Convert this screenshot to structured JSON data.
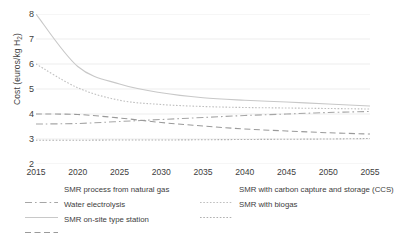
{
  "chart_data": {
    "type": "line",
    "title": "",
    "xlabel": "",
    "ylabel": "Cost (euros/kg H2)",
    "ylabel_prefix": "Cost (euros/kg H",
    "ylabel_sub": "2",
    "ylabel_suffix": ")",
    "x": [
      2015,
      2020,
      2025,
      2030,
      2035,
      2040,
      2045,
      2050,
      2055
    ],
    "xticklabels": [
      "2015",
      "2020",
      "2025",
      "2030",
      "2035",
      "2040",
      "2045",
      "2050",
      "2055"
    ],
    "yticklabels": [
      "8",
      "7",
      "6",
      "5",
      "4",
      "3",
      "2"
    ],
    "ylim": [
      2,
      8
    ],
    "xlim": [
      2015,
      2055
    ],
    "grid": true,
    "legend_position": "bottom",
    "series": [
      {
        "name": "SMR process from natural gas",
        "style": "dash-dot",
        "color": "#a6a6a6",
        "values": [
          3.6,
          3.62,
          3.7,
          3.78,
          3.86,
          3.94,
          4.0,
          4.06,
          4.1
        ]
      },
      {
        "name": "SMR with carbon capture and storage (CCS)",
        "style": "dotted",
        "color": "#bfbfbf",
        "values": [
          6.0,
          5.05,
          4.55,
          4.38,
          4.3,
          4.26,
          4.24,
          4.22,
          4.2
        ]
      },
      {
        "name": "Water electrolysis",
        "style": "solid",
        "color": "#c8c8c8",
        "values": [
          8.0,
          5.9,
          5.2,
          4.85,
          4.65,
          4.55,
          4.48,
          4.4,
          4.32
        ]
      },
      {
        "name": "SMR with biogas",
        "style": "dotted",
        "color": "#b0b0b0",
        "values": [
          2.95,
          2.95,
          2.96,
          2.96,
          2.97,
          2.98,
          2.99,
          3.0,
          3.02
        ]
      },
      {
        "name": "SMR on-site type station",
        "style": "dashed",
        "color": "#9a9a9a",
        "values": [
          4.0,
          3.98,
          3.84,
          3.66,
          3.52,
          3.4,
          3.32,
          3.25,
          3.2
        ]
      }
    ]
  },
  "legend": {
    "items": [
      {
        "label": "SMR process from natural gas",
        "series": 0
      },
      {
        "label": "SMR with carbon capture and storage (CCS)",
        "series": 1
      },
      {
        "label": "Water electrolysis",
        "series": 2
      },
      {
        "label": "SMR with biogas",
        "series": 3
      },
      {
        "label": "SMR on-site type station",
        "series": 4
      }
    ]
  }
}
